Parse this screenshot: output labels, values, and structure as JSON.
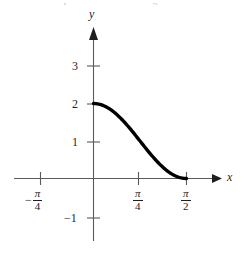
{
  "figure": {
    "background": "#ffffff",
    "ink_color": "#1f1f1f",
    "curve_color": "#000000",
    "axis_color": "#5a5a5a"
  },
  "axes": {
    "x_label": "x",
    "y_label": "y"
  },
  "top_crumbs": {
    "left": "4",
    "right": "2"
  },
  "y_ticks": [
    {
      "label": "3",
      "value": 3
    },
    {
      "label": "2",
      "value": 2
    },
    {
      "label": "1",
      "value": 1
    },
    {
      "label": "−1",
      "value": -1
    }
  ],
  "x_ticks": [
    {
      "sign": "−",
      "numerator": "π",
      "denominator": "4",
      "label": "−π/4",
      "value": -0.7853981634
    },
    {
      "sign": "",
      "numerator": "π",
      "denominator": "4",
      "label": "π/4",
      "value": 0.7853981634
    },
    {
      "sign": "",
      "numerator": "π",
      "denominator": "2",
      "label": "π/2",
      "value": 1.5707963268
    }
  ],
  "chart_data": {
    "type": "line",
    "title": "",
    "xlabel": "x",
    "ylabel": "y",
    "xlim": [
      -1.1,
      1.95
    ],
    "ylim": [
      -1.45,
      3.35
    ],
    "grid": false,
    "legend": null,
    "series": [
      {
        "name": "y = 2cos^2(x)",
        "expression": "2*cos(x)^2",
        "domain": [
          0,
          1.5707963268
        ],
        "x": [
          0.0,
          0.0982,
          0.1963,
          0.2945,
          0.3927,
          0.4909,
          0.589,
          0.6872,
          0.7854,
          0.8836,
          0.9817,
          1.0799,
          1.1781,
          1.2763,
          1.3744,
          1.4726,
          1.5708
        ],
        "y": [
          2.0,
          1.9616,
          1.8478,
          1.6682,
          1.4142,
          1.1481,
          0.8536,
          0.5858,
          0.7854,
          0.5858,
          0.3473,
          0.1522,
          0.0381,
          0.0,
          0.0,
          0.0,
          0.0
        ],
        "y_values": [
          2.0,
          1.9616,
          1.8478,
          1.6629,
          1.4142,
          1.1716,
          0.9134,
          0.6173,
          0.7654,
          0.4142,
          0.3473,
          0.1522,
          0.0761,
          0.0381,
          0.0152,
          0.0038,
          0.0
        ],
        "endpoints": [
          {
            "x": 0.0,
            "y": 2.0
          },
          {
            "x": 1.5707963268,
            "y": 0.0
          }
        ],
        "midpoint": {
          "x": 0.7853981634,
          "y": 0.79
        }
      }
    ]
  }
}
